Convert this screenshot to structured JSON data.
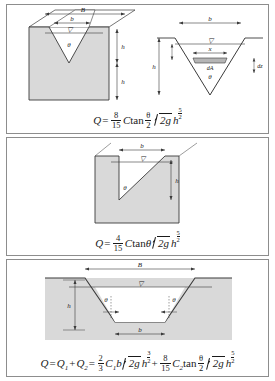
{
  "figure": {
    "panels": [
      {
        "id": "v-notch",
        "name": "V-notch (triangular) weir",
        "labels": {
          "channel_width": "B",
          "notch_top_width": "b",
          "head": "h",
          "crest_height": "h",
          "crest_height_sub": "a",
          "angle": "θ",
          "strip_width": "x",
          "strip_area": "dA",
          "strip_thickness": "dz",
          "water_surface": "▽"
        },
        "equation": {
          "lhs": "Q",
          "equals": "=",
          "coefficient_num": "8",
          "coefficient_den": "15",
          "C": "C",
          "tan": "tan",
          "angle_num": "θ",
          "angle_den": "2",
          "radicand": "2g",
          "h": "h",
          "exp_num": "5",
          "exp_den": "2",
          "plain": "Q = (8/15) C tan(θ/2) √(2g) h^(5/2)"
        }
      },
      {
        "id": "right-triangular-notch",
        "name": "Right-angled triangular notch",
        "labels": {
          "notch_top_width": "b",
          "head": "h",
          "angle": "θ",
          "water_surface": "▽"
        },
        "equation": {
          "lhs": "Q",
          "equals": "=",
          "coefficient_num": "4",
          "coefficient_den": "15",
          "C": "C",
          "tan": "tan",
          "angle": "θ",
          "radicand": "2g",
          "h": "h",
          "exp_num": "5",
          "exp_den": "2",
          "plain": "Q = (4/15) C tanθ √(2g) h^(5/2)"
        }
      },
      {
        "id": "trapezoidal-notch",
        "name": "Trapezoidal (Cipolletti) notch",
        "labels": {
          "top_width": "B",
          "bottom_width": "b",
          "head": "h",
          "angle_left": "θ",
          "angle_right": "θ",
          "water_surface": "▽"
        },
        "equation": {
          "lhs": "Q",
          "equals_1": "=",
          "q1": "Q",
          "q1_sub": "1",
          "plus_1": "+",
          "q2": "Q",
          "q2_sub": "2",
          "equals_2": "=",
          "term1_num": "2",
          "term1_den": "3",
          "C1": "C",
          "C1_sub": "1",
          "b": "b",
          "radicand_1": "2g",
          "h_1": "h",
          "exp1_num": "3",
          "exp1_den": "2",
          "plus_2": "+",
          "term2_num": "8",
          "term2_den": "15",
          "C2": "C",
          "C2_sub": "2",
          "tan": "tan",
          "angle_num": "θ",
          "angle_den": "2",
          "radicand_2": "2g",
          "h_2": "h",
          "exp2_num": "5",
          "exp2_den": "2",
          "plain": "Q = Q1 + Q2 = (2/3) C1 b √(2g) h^(3/2) + (8/15) C2 tan(θ/2) √(2g) h^(5/2)"
        }
      }
    ]
  },
  "colors": {
    "fill": "#d9d9d9",
    "line": "#3a3a3a",
    "border": "#8d8d8d",
    "strip": "#b5b5b5",
    "text": "#1a1a1a"
  }
}
